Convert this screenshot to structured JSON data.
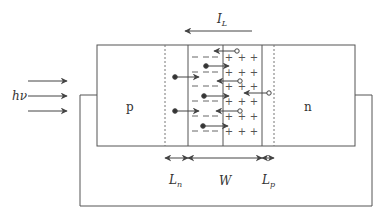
{
  "figure": {
    "type": "p-n junction photodiode diagram",
    "labels": {
      "photon": "hν",
      "p_region": "p",
      "n_region": "n",
      "current_main": "I",
      "current_sub": "L",
      "ln_main": "L",
      "ln_sub": "n",
      "w": "W",
      "lp_main": "L",
      "lp_sub": "p"
    },
    "colors": {
      "line": "#555555",
      "text": "#333333",
      "background": "#ffffff"
    },
    "regions": [
      {
        "name": "p-region",
        "label": "p"
      },
      {
        "name": "depletion-region",
        "label": "W",
        "negative_charges": "−",
        "positive_charges": "+"
      },
      {
        "name": "n-region",
        "label": "n"
      }
    ],
    "incident_light_arrows": 3,
    "carriers": {
      "electrons_filled_dots": 6,
      "holes_open_circles": 4
    }
  }
}
